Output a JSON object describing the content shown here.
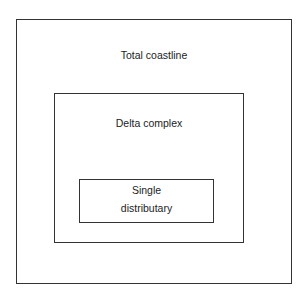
{
  "diagram": {
    "type": "nested-boxes",
    "boxes": [
      {
        "label": "Total coastline"
      },
      {
        "label": "Delta complex"
      },
      {
        "label_line1": "Single",
        "label_line2": "distributary"
      }
    ]
  }
}
